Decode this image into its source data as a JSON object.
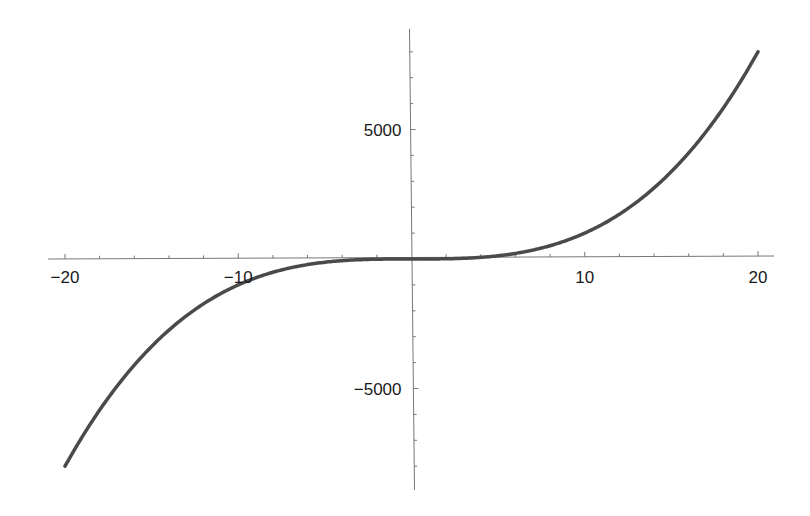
{
  "chart_data": {
    "type": "line",
    "title": "",
    "xlabel": "",
    "ylabel": "",
    "function": "x^3",
    "xlim": [
      -20,
      20
    ],
    "ylim": [
      -8000,
      8000
    ],
    "grid": false,
    "legend": "none",
    "x_ticks": [
      -20,
      -10,
      10,
      20
    ],
    "x_tick_labels": [
      "−20",
      "−10",
      "10",
      "20"
    ],
    "x_minor_step": 2,
    "y_ticks": [
      5000,
      -5000
    ],
    "y_tick_labels": [
      "5000",
      "−5000"
    ],
    "y_minor_step": 1000,
    "series": [
      {
        "name": "x^3",
        "color": "#4a4a4a",
        "x": [
          -20,
          -18,
          -16,
          -14,
          -12,
          -10,
          -8,
          -6,
          -4,
          -2,
          0,
          2,
          4,
          6,
          8,
          10,
          12,
          14,
          16,
          18,
          20
        ],
        "y": [
          -8000,
          -5832,
          -4096,
          -2744,
          -1728,
          -1000,
          -512,
          -216,
          -64,
          -8,
          0,
          8,
          64,
          216,
          512,
          1000,
          1728,
          2744,
          4096,
          5832,
          8000
        ]
      }
    ]
  }
}
